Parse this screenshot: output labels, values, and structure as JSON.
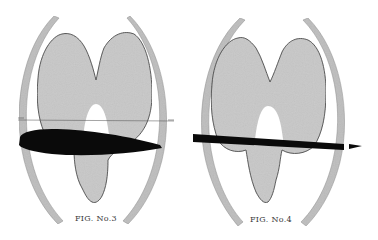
{
  "figures": [
    {
      "id": "fig3",
      "caption": "FIG. No.3",
      "description": "Polar pressure diagram around a thick airfoil section",
      "airfoil": "thick"
    },
    {
      "id": "fig4",
      "caption": "FIG. No.4",
      "description": "Polar pressure diagram around a thin flat-plate section",
      "airfoil": "thin"
    }
  ],
  "colors": {
    "background": "#ffffff",
    "lobe_fill": "#c8c8c8",
    "lobe_outline": "#3c3c3c",
    "ring_fill": "#bdbdbd",
    "airfoil": "#0a0a0a",
    "caption": "#3a3a3a"
  }
}
